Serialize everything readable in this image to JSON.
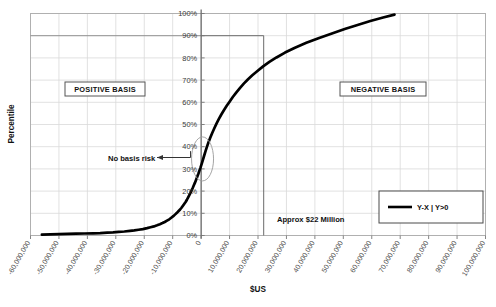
{
  "chart_data": {
    "type": "line",
    "title": "",
    "xlabel": "$US",
    "ylabel": "Percentile",
    "xlim": [
      -60000000,
      100000000
    ],
    "ylim": [
      0,
      1
    ],
    "grid": true,
    "legend_position": "bottom-right",
    "x_tick_labels": [
      "-60,000,000",
      "-50,000,000",
      "-40,000,000",
      "-30,000,000",
      "-20,000,000",
      "-10,000,000",
      "0",
      "10,000,000",
      "20,000,000",
      "30,000,000",
      "40,000,000",
      "50,000,000",
      "60,000,000",
      "70,000,000",
      "80,000,000",
      "90,000,000",
      "100,000,000"
    ],
    "x_tick_values": [
      -60000000,
      -50000000,
      -40000000,
      -30000000,
      -20000000,
      -10000000,
      0,
      10000000,
      20000000,
      30000000,
      40000000,
      50000000,
      60000000,
      70000000,
      80000000,
      90000000,
      100000000
    ],
    "y_tick_labels": [
      "0%",
      "10%",
      "20%",
      "30%",
      "40%",
      "50%",
      "60%",
      "70%",
      "80%",
      "90%",
      "100%"
    ],
    "y_tick_values": [
      0,
      0.1,
      0.2,
      0.3,
      0.4,
      0.5,
      0.6,
      0.7,
      0.8,
      0.9,
      1.0
    ],
    "series": [
      {
        "name": "Y-X | Y>0",
        "color": "#000000",
        "x": [
          -56000000,
          -53000000,
          -50000000,
          -47000000,
          -44000000,
          -41000000,
          -38000000,
          -35500000,
          -33000000,
          -31000000,
          -29000000,
          -27000000,
          -25000000,
          -23500000,
          -22000000,
          -20500000,
          -19000000,
          -17800000,
          -16600000,
          -15500000,
          -14500000,
          -13600000,
          -12800000,
          -12000000,
          -11200000,
          -10500000,
          -9800000,
          -9200000,
          -8600000,
          -8000000,
          -7400000,
          -6900000,
          -6400000,
          -5900000,
          -5400000,
          -5000000,
          -4600000,
          -4200000,
          -3800000,
          -3400000,
          -3000000,
          -2600000,
          -2200000,
          -1800000,
          -1400000,
          -1000000,
          -600000,
          -200000,
          200000,
          600000,
          1000000,
          1500000,
          2000000,
          2600000,
          3200000,
          3900000,
          4600000,
          5400000,
          6200000,
          7100000,
          8000000,
          9000000,
          10000000,
          11200000,
          12400000,
          13700000,
          15000000,
          16500000,
          18000000,
          19800000,
          21800000,
          24000000,
          26500000,
          29500000,
          33000000,
          37000000,
          41500000,
          46000000,
          50500000,
          55000000,
          59500000,
          64000000,
          68000000
        ],
        "y": [
          0.004,
          0.005,
          0.006,
          0.007,
          0.008,
          0.009,
          0.01,
          0.011,
          0.013,
          0.014,
          0.016,
          0.018,
          0.021,
          0.023,
          0.026,
          0.029,
          0.033,
          0.037,
          0.041,
          0.046,
          0.051,
          0.056,
          0.061,
          0.067,
          0.073,
          0.08,
          0.087,
          0.094,
          0.101,
          0.109,
          0.117,
          0.125,
          0.134,
          0.143,
          0.152,
          0.161,
          0.171,
          0.181,
          0.191,
          0.202,
          0.213,
          0.225,
          0.237,
          0.25,
          0.263,
          0.277,
          0.292,
          0.307,
          0.323,
          0.34,
          0.357,
          0.378,
          0.398,
          0.42,
          0.44,
          0.462,
          0.482,
          0.504,
          0.524,
          0.545,
          0.564,
          0.584,
          0.603,
          0.625,
          0.645,
          0.665,
          0.684,
          0.704,
          0.722,
          0.741,
          0.762,
          0.782,
          0.802,
          0.824,
          0.846,
          0.868,
          0.89,
          0.91,
          0.93,
          0.948,
          0.966,
          0.982,
          0.995
        ]
      }
    ],
    "reference_lines": [
      {
        "name": "ninety-percentile-horizontal",
        "orientation": "horizontal",
        "value": 0.9,
        "label": "90%"
      },
      {
        "name": "twenty-two-million-vertical",
        "orientation": "vertical",
        "value": 22000000,
        "label": "Approx $22 Million"
      },
      {
        "name": "zero-axis-vertical",
        "orientation": "vertical",
        "value": 0,
        "label": "0"
      }
    ],
    "annotations": [
      {
        "id": "positive-basis",
        "text": "POSITIVE BASIS",
        "boxed": true
      },
      {
        "id": "negative-basis",
        "text": "NEGATIVE BASIS",
        "boxed": true
      },
      {
        "id": "no-basis-risk",
        "text": "No basis risk",
        "boxed": false,
        "arrow": true
      },
      {
        "id": "approx-22-million",
        "text": "Approx $22 Million",
        "boxed": false
      }
    ]
  },
  "axes": {
    "x_title": "$US",
    "y_title": "Percentile"
  },
  "legend": {
    "entries": [
      {
        "label": "Y-X | Y>0",
        "color": "#000000"
      }
    ]
  },
  "annotations": {
    "positive_basis": "POSITIVE BASIS",
    "negative_basis": "NEGATIVE BASIS",
    "no_basis_risk": "No basis risk",
    "approx_amount": "Approx $22 Million"
  },
  "ticks": {
    "x": [
      "-60,000,000",
      "-50,000,000",
      "-40,000,000",
      "-30,000,000",
      "-20,000,000",
      "-10,000,000",
      "0",
      "10,000,000",
      "20,000,000",
      "30,000,000",
      "40,000,000",
      "50,000,000",
      "60,000,000",
      "70,000,000",
      "80,000,000",
      "90,000,000",
      "100,000,000"
    ],
    "y": [
      "0%",
      "10%",
      "20%",
      "30%",
      "40%",
      "50%",
      "60%",
      "70%",
      "80%",
      "90%",
      "100%"
    ]
  },
  "colors": {
    "series": "#000000",
    "grid": "#d9d9d9",
    "axis": "#808080",
    "text": "#1a1a1a"
  }
}
